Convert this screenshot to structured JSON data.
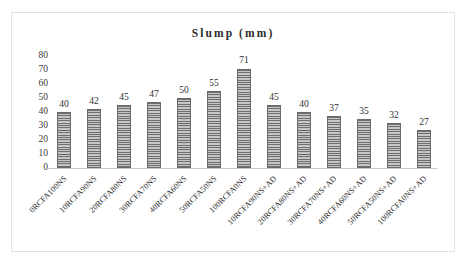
{
  "chart_data": {
    "type": "bar",
    "title": "Slump (mm)",
    "xlabel": "",
    "ylabel": "",
    "ylim": [
      0,
      80
    ],
    "yticks": [
      80,
      70,
      60,
      50,
      40,
      30,
      20,
      10,
      0
    ],
    "grid": false,
    "legend": false,
    "bar_color": "#8f8f8f",
    "bar_pattern": "horizontal-stripes",
    "data_labels": true,
    "categories": [
      "0RCFA100NS",
      "10RCFA90NS",
      "20RCFA80NS",
      "30RCFA70NS",
      "40RCFA60NS",
      "50RCFA50NS",
      "100RCFA0NS",
      "10RCFA90NS+AD",
      "20RCFA80NS+AD",
      "30RCFA70NS+AD",
      "40RCFA60NS+AD",
      "50RCFA50NS+AD",
      "100RCFA0NS+AD"
    ],
    "values": [
      40,
      42,
      45,
      47,
      50,
      55,
      71,
      45,
      40,
      37,
      35,
      32,
      27
    ]
  }
}
